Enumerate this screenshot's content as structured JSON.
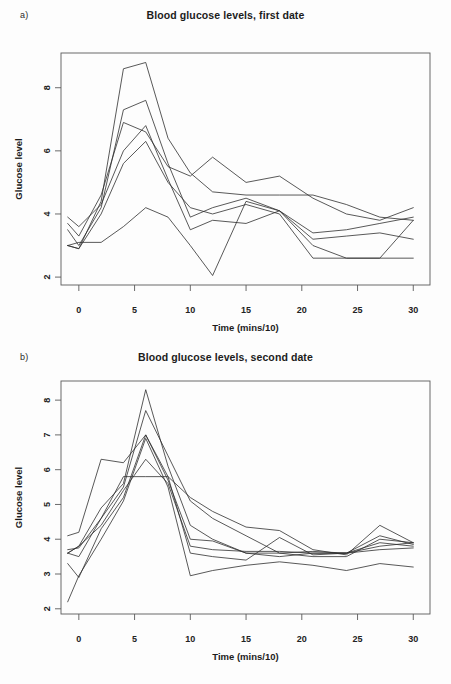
{
  "document": {
    "background": "#fdfdfd",
    "ink": "#2e2e2e"
  },
  "panels": [
    {
      "letter": "a)",
      "title": "Blood glucose levels, first date"
    },
    {
      "letter": "b)",
      "title": "Blood glucose levels, second date"
    }
  ],
  "chart_data": [
    {
      "type": "line",
      "title": "Blood glucose levels, first date",
      "panel": "a)",
      "xlabel": "Time (mins/10)",
      "ylabel": "Glucose level",
      "xlim": [
        -1.6,
        31.5
      ],
      "ylim": [
        1.75,
        9.1
      ],
      "xticks": [
        0,
        5,
        10,
        15,
        20,
        25,
        30
      ],
      "yticks": [
        2,
        4,
        6,
        8
      ],
      "grid": false,
      "legend": "none",
      "x": [
        -1,
        0,
        2,
        4,
        6,
        8,
        10,
        12,
        15,
        18,
        21,
        24,
        27,
        30
      ],
      "series": [
        {
          "name": "subject-1",
          "values": [
            3.0,
            2.9,
            4.4,
            8.6,
            8.8,
            6.4,
            5.3,
            4.7,
            4.6,
            4.6,
            4.6,
            4.3,
            3.9,
            3.8
          ]
        },
        {
          "name": "subject-2",
          "values": [
            3.5,
            3.0,
            4.2,
            7.3,
            7.6,
            5.6,
            3.9,
            4.2,
            4.5,
            4.1,
            3.4,
            3.5,
            3.7,
            3.9
          ]
        },
        {
          "name": "subject-3",
          "values": [
            3.7,
            3.3,
            4.6,
            6.9,
            6.6,
            5.5,
            5.2,
            5.8,
            5.0,
            5.2,
            4.5,
            4.0,
            3.8,
            4.2
          ]
        },
        {
          "name": "subject-4",
          "values": [
            3.9,
            3.6,
            4.3,
            6.0,
            6.8,
            5.1,
            3.5,
            3.8,
            3.7,
            4.1,
            3.2,
            3.3,
            3.4,
            3.2
          ]
        },
        {
          "name": "subject-5",
          "values": [
            3.0,
            2.9,
            4.0,
            5.6,
            6.3,
            5.0,
            4.2,
            4.0,
            4.3,
            4.0,
            2.6,
            2.6,
            2.6,
            2.6
          ]
        },
        {
          "name": "subject-6",
          "values": [
            3.0,
            3.1,
            3.1,
            3.6,
            4.2,
            3.9,
            3.0,
            2.05,
            4.4,
            4.1,
            3.0,
            2.6,
            2.6,
            3.8
          ]
        }
      ]
    },
    {
      "type": "line",
      "title": "Blood glucose levels, second date",
      "panel": "b)",
      "xlabel": "Time (mins/10)",
      "ylabel": "Glucose level",
      "xlim": [
        -1.6,
        31.5
      ],
      "ylim": [
        1.85,
        8.55
      ],
      "xticks": [
        0,
        5,
        10,
        15,
        20,
        25,
        30
      ],
      "yticks": [
        2,
        3,
        4,
        5,
        6,
        7,
        8
      ],
      "grid": false,
      "legend": "none",
      "x": [
        -1,
        0,
        2,
        4,
        6,
        8,
        10,
        12,
        15,
        18,
        21,
        24,
        27,
        30
      ],
      "series": [
        {
          "name": "subject-1",
          "values": [
            3.6,
            3.8,
            4.9,
            5.6,
            8.3,
            6.1,
            4.4,
            4.0,
            3.6,
            3.5,
            3.6,
            3.6,
            3.8,
            3.9
          ]
        },
        {
          "name": "subject-2",
          "values": [
            3.6,
            3.5,
            4.6,
            5.5,
            7.7,
            6.4,
            5.1,
            4.6,
            4.1,
            3.6,
            3.5,
            3.5,
            4.0,
            3.9
          ]
        },
        {
          "name": "subject-3",
          "values": [
            4.1,
            4.2,
            6.3,
            6.2,
            7.0,
            5.7,
            4.0,
            3.95,
            3.6,
            3.6,
            3.65,
            3.6,
            3.9,
            3.8
          ]
        },
        {
          "name": "subject-4",
          "values": [
            3.3,
            2.9,
            4.3,
            5.2,
            7.0,
            5.8,
            5.2,
            4.8,
            4.35,
            4.25,
            3.7,
            3.55,
            4.4,
            3.9
          ]
        },
        {
          "name": "subject-5",
          "values": [
            3.6,
            3.8,
            4.4,
            5.4,
            6.3,
            5.6,
            3.8,
            3.7,
            3.65,
            3.65,
            3.6,
            3.6,
            3.7,
            3.75
          ]
        },
        {
          "name": "subject-6",
          "values": [
            3.7,
            3.75,
            4.6,
            5.8,
            5.8,
            5.8,
            3.6,
            3.5,
            3.4,
            4.05,
            3.55,
            3.6,
            4.1,
            3.85
          ]
        },
        {
          "name": "subject-7",
          "values": [
            2.2,
            2.95,
            4.0,
            5.1,
            6.9,
            5.5,
            2.95,
            3.1,
            3.25,
            3.35,
            3.25,
            3.1,
            3.3,
            3.2
          ]
        }
      ]
    }
  ]
}
